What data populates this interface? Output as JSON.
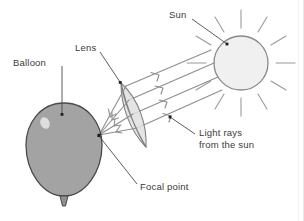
{
  "figure": {
    "background_color": "#ffffff"
  },
  "labels": {
    "sun": "Sun",
    "lens": "Lens",
    "balloon": "Balloon",
    "focal_point": "Focal point",
    "light_rays_line1": "Light rays",
    "light_rays_line2": "from the sun"
  },
  "colors": {
    "balloon_fill": "#a3a3a3",
    "balloon_stroke": "#4a4a4a",
    "balloon_highlight": "#eeeeee",
    "sun_fill": "#f0f0f0",
    "sun_stroke": "#8a8a8a",
    "sun_ray": "#9a9a9a",
    "lens_stroke": "#6d6d6d",
    "light_ray": "#8e8e8e",
    "leader_line": "#4a4a4a",
    "text": "#3b3b3b"
  },
  "objects": {
    "sun": {
      "cx": 241,
      "cy": 63,
      "r": 27,
      "ray_count": 12
    },
    "balloon": {
      "cx": 64,
      "cy": 148,
      "rx": 38,
      "ry": 45
    },
    "lens": {
      "top_x": 121,
      "top_y": 83,
      "bottom_x": 146,
      "bottom_y": 147
    },
    "focal_point": {
      "x": 99,
      "y": 135
    }
  },
  "rays": {
    "incoming_count": 4,
    "converging_count": 4,
    "direction": "from upper-right sun toward lens, converging to focal point on balloon"
  }
}
